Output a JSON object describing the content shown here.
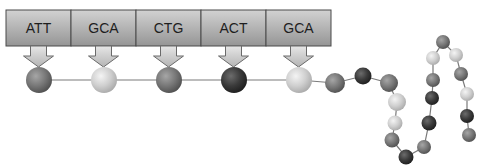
{
  "diagram": {
    "colors": {
      "background": "#ffffff",
      "box_top": "#d2d2d2",
      "box_bottom": "#959595",
      "box_border": "#4a4a4a",
      "arrow_fill_top": "#e6e6e6",
      "arrow_fill_bottom": "#b4b4b4",
      "arrow_border": "#6a6a6a",
      "bond_line": "#7a7a7a",
      "amino_light": "#cfcfcf",
      "amino_mid": "#777777",
      "amino_dark": "#3a3a3a"
    },
    "codons": [
      {
        "label": "ATT",
        "amino_shade": "mid"
      },
      {
        "label": "GCA",
        "amino_shade": "light"
      },
      {
        "label": "CTG",
        "amino_shade": "mid"
      },
      {
        "label": "ACT",
        "amino_shade": "dark"
      },
      {
        "label": "GCA",
        "amino_shade": "light"
      }
    ],
    "chain_tail": [
      {
        "x": 335,
        "y": 83,
        "r": 10,
        "shade": "mid"
      },
      {
        "x": 363,
        "y": 76,
        "r": 8.5,
        "shade": "dark"
      },
      {
        "x": 389,
        "y": 83,
        "r": 9,
        "shade": "mid"
      },
      {
        "x": 397,
        "y": 102,
        "r": 9,
        "shade": "light"
      },
      {
        "x": 395,
        "y": 123,
        "r": 7.5,
        "shade": "light"
      },
      {
        "x": 392,
        "y": 140,
        "r": 7.5,
        "shade": "mid"
      },
      {
        "x": 406,
        "y": 157,
        "r": 7.5,
        "shade": "dark"
      },
      {
        "x": 424,
        "y": 147,
        "r": 7,
        "shade": "mid"
      },
      {
        "x": 429,
        "y": 123,
        "r": 7.5,
        "shade": "dark"
      },
      {
        "x": 432,
        "y": 98,
        "r": 7,
        "shade": "dark"
      },
      {
        "x": 433,
        "y": 80,
        "r": 7,
        "shade": "mid"
      },
      {
        "x": 433,
        "y": 58,
        "r": 7,
        "shade": "light"
      },
      {
        "x": 443,
        "y": 42,
        "r": 7,
        "shade": "mid"
      },
      {
        "x": 456,
        "y": 55,
        "r": 7,
        "shade": "light"
      },
      {
        "x": 461,
        "y": 74,
        "r": 7,
        "shade": "mid"
      },
      {
        "x": 467,
        "y": 94,
        "r": 7,
        "shade": "light"
      },
      {
        "x": 467,
        "y": 116,
        "r": 7,
        "shade": "dark"
      },
      {
        "x": 469,
        "y": 135,
        "r": 7,
        "shade": "mid"
      }
    ]
  }
}
